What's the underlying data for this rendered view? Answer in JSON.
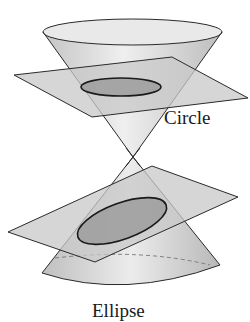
{
  "diagram": {
    "labels": {
      "upper": "Circle",
      "lower": "Ellipse"
    },
    "colors": {
      "cone_fill": "#d9d9d9",
      "plane_fill": "#c8c8c8",
      "section_fill": "#9a9a9a",
      "outline": "#2a2a2a",
      "background": "#ffffff"
    },
    "nodes": [
      {
        "id": "upper-cone",
        "kind": "cone-nappe"
      },
      {
        "id": "horizontal-plane",
        "kind": "plane"
      },
      {
        "id": "circle-section",
        "kind": "intersection",
        "label": "Circle"
      },
      {
        "id": "lower-cone",
        "kind": "cone-nappe"
      },
      {
        "id": "tilted-plane",
        "kind": "plane"
      },
      {
        "id": "ellipse-section",
        "kind": "intersection",
        "label": "Ellipse"
      }
    ]
  }
}
